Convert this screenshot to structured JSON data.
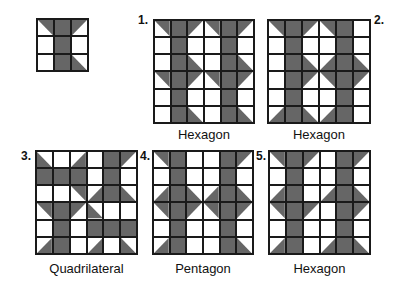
{
  "colors": {
    "fill": "#666666",
    "line": "#1a1a1a",
    "background": "#ffffff"
  },
  "cell_legend": {
    "F": "full gray square",
    "W": "white square",
    "UR": "gray triangle: top-left, top-right, bottom-right",
    "UL": "gray triangle: top-left, top-right, bottom-left",
    "LL": "gray triangle: top-left, bottom-left, bottom-right",
    "LR": "gray triangle: top-right, bottom-right, bottom-left"
  },
  "reference_tile": {
    "rows": [
      [
        "UR",
        "F",
        "UL"
      ],
      [
        "W",
        "F",
        "W"
      ],
      [
        "W",
        "F",
        "LL"
      ]
    ]
  },
  "panels": [
    {
      "number": "1.",
      "caption": "Hexagon",
      "rows": [
        [
          "UR",
          "F",
          "UL",
          "UR",
          "F",
          "UL"
        ],
        [
          "W",
          "F",
          "W",
          "W",
          "F",
          "W"
        ],
        [
          "W",
          "F",
          "LL",
          "W",
          "F",
          "LL"
        ],
        [
          "UR",
          "F",
          "UL",
          "UR",
          "F",
          "UL"
        ],
        [
          "W",
          "F",
          "W",
          "W",
          "F",
          "W"
        ],
        [
          "W",
          "F",
          "LL",
          "W",
          "F",
          "LL"
        ]
      ]
    },
    {
      "number": "2.",
      "caption": "Hexagon",
      "rows": [
        [
          "UR",
          "F",
          "UL",
          "UR",
          "F",
          "W"
        ],
        [
          "W",
          "F",
          "W",
          "W",
          "F",
          "W"
        ],
        [
          "W",
          "F",
          "LL",
          "LR",
          "F",
          "LL"
        ],
        [
          "W",
          "F",
          "UL",
          "UR",
          "F",
          "UL"
        ],
        [
          "W",
          "F",
          "W",
          "W",
          "F",
          "W"
        ],
        [
          "LR",
          "F",
          "LL",
          "LR",
          "F",
          "W"
        ]
      ]
    },
    {
      "number": "3.",
      "caption": "Quadrilateral",
      "rows": [
        [
          "LL",
          "W",
          "LR",
          "W",
          "F",
          "UL"
        ],
        [
          "F",
          "F",
          "F",
          "W",
          "F",
          "W"
        ],
        [
          "W",
          "W",
          "UR",
          "LR",
          "F",
          "LL"
        ],
        [
          "UR",
          "F",
          "UL",
          "LL",
          "W",
          "W"
        ],
        [
          "W",
          "F",
          "W",
          "F",
          "F",
          "F"
        ],
        [
          "LR",
          "F",
          "W",
          "LR",
          "W",
          "LL"
        ]
      ]
    },
    {
      "number": "4.",
      "caption": "Pentagon",
      "rows": [
        [
          "UR",
          "F",
          "W",
          "W",
          "F",
          "UL"
        ],
        [
          "W",
          "F",
          "W",
          "W",
          "F",
          "W"
        ],
        [
          "LR",
          "F",
          "LL",
          "LR",
          "F",
          "LL"
        ],
        [
          "UR",
          "F",
          "UL",
          "UR",
          "F",
          "UL"
        ],
        [
          "W",
          "F",
          "W",
          "W",
          "F",
          "W"
        ],
        [
          "LR",
          "F",
          "W",
          "W",
          "F",
          "LL"
        ]
      ]
    },
    {
      "number": "5.",
      "caption": "Hexagon",
      "rows": [
        [
          "UR",
          "F",
          "UL",
          "W",
          "F",
          "UL"
        ],
        [
          "W",
          "F",
          "W",
          "W",
          "F",
          "W"
        ],
        [
          "LR",
          "F",
          "W",
          "LR",
          "F",
          "LL"
        ],
        [
          "UR",
          "F",
          "UL",
          "W",
          "F",
          "UL"
        ],
        [
          "W",
          "F",
          "W",
          "W",
          "F",
          "W"
        ],
        [
          "LR",
          "F",
          "W",
          "LR",
          "F",
          "LL"
        ]
      ]
    }
  ]
}
